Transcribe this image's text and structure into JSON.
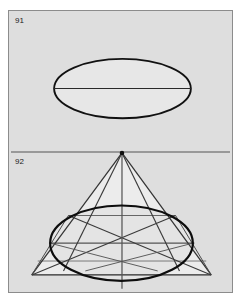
{
  "plate": {
    "background_color": "#ffffff",
    "panel_color": "#dedede",
    "panel_border_color": "#8c8c8c",
    "ink_color": "#1a1a1a",
    "construction_line_color": "#555555",
    "fill_color": "#e8e8e8",
    "width": 248,
    "height": 305
  },
  "figures": [
    {
      "id": "figure-91",
      "label": "91",
      "caption": "",
      "type": "ellipse",
      "description": "Plain ellipse with horizontal major-axis chord",
      "geometry": {
        "center_x": 122.5,
        "center_y": 88,
        "radius_x": 69,
        "radius_y": 30,
        "major_axis_line": {
          "x1": 53.5,
          "y1": 88,
          "x2": 191.5,
          "y2": 88
        }
      }
    },
    {
      "id": "figure-92",
      "label": "92",
      "caption": "",
      "type": "cone-ellipse-construction",
      "description": "Ellipse inscribed in a triangle/cone with apex on a horizontal datum line, diagonals, tangent horizontals and vertical axis",
      "geometry": {
        "datum_line": {
          "x1": 0,
          "y1": 142,
          "x2": 225,
          "y2": 142
        },
        "apex": {
          "x": 114,
          "y": 143
        },
        "base_left": {
          "x": 23,
          "y": 266
        },
        "base_right": {
          "x": 204,
          "y": 266
        },
        "ellipse": {
          "center_x": 113.5,
          "center_y": 234,
          "radius_x": 72,
          "radius_y": 38
        },
        "vertical_axis": {
          "x1": 114,
          "y1": 143,
          "x2": 114,
          "y2": 280
        },
        "tangent_horizontals_y": [
          206,
          234,
          252,
          266
        ],
        "inner_cone_left": {
          "x": 67,
          "y": 206
        },
        "inner_cone_right": {
          "x": 161,
          "y": 206
        }
      }
    }
  ]
}
